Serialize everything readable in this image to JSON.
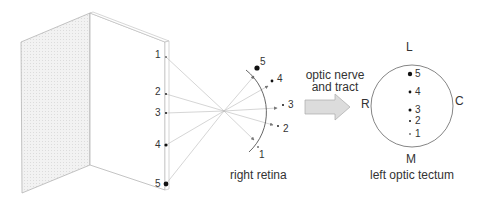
{
  "screen": {
    "points": [
      {
        "label": "1",
        "x": 166,
        "y": 57,
        "r": 0.8
      },
      {
        "label": "2",
        "x": 166,
        "y": 94,
        "r": 0.9
      },
      {
        "label": "3",
        "x": 166,
        "y": 113,
        "r": 1.0
      },
      {
        "label": "4",
        "x": 166,
        "y": 145,
        "r": 1.6
      },
      {
        "label": "5",
        "x": 166,
        "y": 184,
        "r": 2.4
      }
    ]
  },
  "retina": {
    "caption": "right retina",
    "points": [
      {
        "label": "1",
        "x": 258,
        "y": 147,
        "r": 0.8
      },
      {
        "label": "2",
        "x": 278,
        "y": 126,
        "r": 0.9
      },
      {
        "label": "3",
        "x": 283,
        "y": 105,
        "r": 1.0
      },
      {
        "label": "4",
        "x": 272,
        "y": 81,
        "r": 1.4
      },
      {
        "label": "5",
        "x": 257,
        "y": 68,
        "r": 2.6
      }
    ]
  },
  "pathway": {
    "label_line1": "optic nerve",
    "label_line2": "and tract"
  },
  "tectum": {
    "caption": "left optic tectum",
    "orientation": {
      "top": "L",
      "bottom": "M",
      "left": "R",
      "right": "C"
    },
    "points": [
      {
        "label": "5",
        "x": 410,
        "y": 74,
        "r": 2.2
      },
      {
        "label": "4",
        "x": 410,
        "y": 92,
        "r": 1.4
      },
      {
        "label": "3",
        "x": 410,
        "y": 110,
        "r": 1.5
      },
      {
        "label": "2",
        "x": 410,
        "y": 121,
        "r": 1.0
      },
      {
        "label": "1",
        "x": 410,
        "y": 134,
        "r": 0.8
      }
    ]
  },
  "colors": {
    "line": "#9a9a9a",
    "ray": "#b5b5b5",
    "dot": "#111111",
    "panel_fill": "#eeeeee",
    "arrow_fill": "#d9d9d9"
  }
}
